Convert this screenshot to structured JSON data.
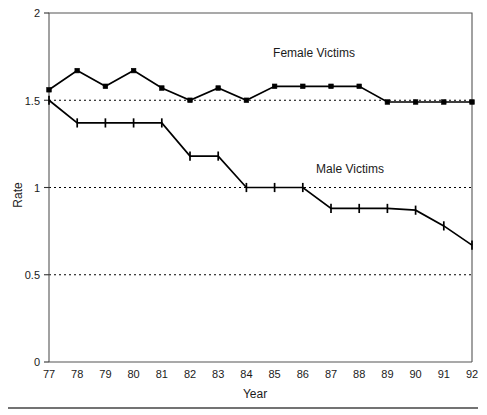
{
  "chart_data": {
    "type": "line",
    "title": "",
    "subtitle": "",
    "xlabel": "Year",
    "ylabel": "Rate",
    "x": [
      77,
      78,
      79,
      80,
      81,
      82,
      83,
      84,
      85,
      86,
      87,
      88,
      89,
      90,
      91,
      92
    ],
    "categories": [
      "77",
      "78",
      "79",
      "80",
      "81",
      "82",
      "83",
      "84",
      "85",
      "86",
      "87",
      "88",
      "89",
      "90",
      "91",
      "92"
    ],
    "xlim": [
      77,
      92
    ],
    "ylim": [
      0,
      2
    ],
    "yticks": [
      0,
      0.5,
      1,
      1.5,
      2
    ],
    "ytick_labels": [
      "0",
      "0.5",
      "1",
      "1.5",
      "2"
    ],
    "xticks": [
      77,
      78,
      79,
      80,
      81,
      82,
      83,
      84,
      85,
      86,
      87,
      88,
      89,
      90,
      91,
      92
    ],
    "xtick_labels": [
      "77",
      "78",
      "79",
      "80",
      "81",
      "82",
      "83",
      "84",
      "85",
      "86",
      "87",
      "88",
      "89",
      "90",
      "91",
      "92"
    ],
    "grid": "horizontal-dashed",
    "gridlines_at": [
      0.5,
      1,
      1.5
    ],
    "legend": "inline-annotations",
    "series": [
      {
        "name": "Female Victims",
        "marker": "filled-square",
        "color": "#000000",
        "values": [
          1.56,
          1.67,
          1.58,
          1.67,
          1.57,
          1.5,
          1.57,
          1.5,
          1.58,
          1.58,
          1.58,
          1.58,
          1.49,
          1.49,
          1.49,
          1.49
        ]
      },
      {
        "name": "Male Victims",
        "marker": "vertical-tick",
        "color": "#000000",
        "values": [
          1.5,
          1.37,
          1.37,
          1.37,
          1.37,
          1.18,
          1.18,
          1.0,
          1.0,
          1.0,
          0.88,
          0.88,
          0.88,
          0.87,
          0.78,
          0.67
        ]
      }
    ],
    "annotations": [
      {
        "text": "Female Victims",
        "x": 85.0,
        "y": 1.84
      },
      {
        "text": "Male Victims",
        "x": 87.3,
        "y": 1.22
      }
    ]
  },
  "axes": {
    "y_title": "Rate",
    "x_title": "Year"
  }
}
